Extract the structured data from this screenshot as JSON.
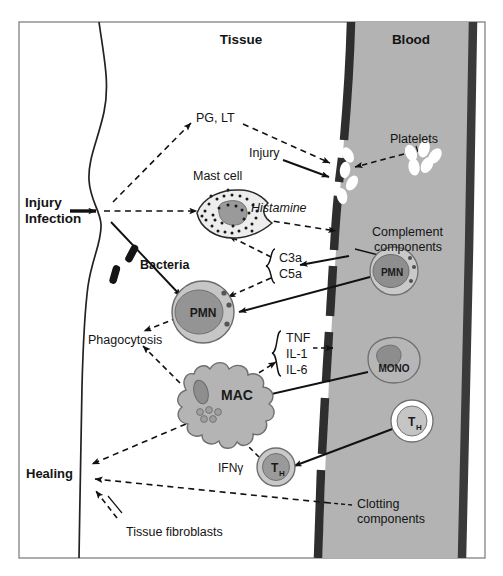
{
  "figure": {
    "compartments": {
      "tissue_label": "Tissue",
      "blood_label": "Blood"
    },
    "colors": {
      "blood_plasma": "#b3b3b3",
      "vessel_wall": "#3d3d3d",
      "cell_fill": "#b8b8b8",
      "cell_nucleus": "#8c8c8c",
      "mast_cell_fill": "#ededed",
      "platelet": "#ffffff",
      "outline": "#1a1a1a",
      "frame": "#8a8a8a",
      "text": "#141414"
    }
  },
  "labels": {
    "tissue": "Tissue",
    "blood": "Blood",
    "injury_infection_line1": "Injury",
    "injury_infection_line2": "Infection",
    "bacteria": "Bacteria",
    "mast_cell": "Mast cell",
    "pg_lt": "PG, LT",
    "injury": "Injury",
    "platelets": "Platelets",
    "histamine": "Histamine",
    "complement_line1": "Complement",
    "complement_line2": "components",
    "c3a": "C3a",
    "c5a": "C5a",
    "pmn_tissue": "PMN",
    "pmn_blood": "PMN",
    "phagocytosis": "Phagocytosis",
    "tnf": "TNF",
    "il1": "IL-1",
    "il6": "IL-6",
    "mono": "MONO",
    "mac": "MAC",
    "th_blood": "T",
    "th_blood_sub": "H",
    "th_tissue": "T",
    "th_tissue_sub": "H",
    "ifn_gamma": "IFNγ",
    "healing": "Healing",
    "tissue_fibroblasts": "Tissue fibroblasts",
    "clotting_line1": "Clotting",
    "clotting_line2": "components"
  },
  "cells": [
    {
      "name": "mast-cell",
      "label": "Mast cell",
      "compartment": "tissue"
    },
    {
      "name": "pmn-tissue",
      "label": "PMN",
      "compartment": "tissue"
    },
    {
      "name": "macrophage",
      "label": "MAC",
      "compartment": "tissue"
    },
    {
      "name": "th-tissue",
      "label": "TH",
      "compartment": "tissue"
    },
    {
      "name": "pmn-blood",
      "label": "PMN",
      "compartment": "blood"
    },
    {
      "name": "monocyte",
      "label": "MONO",
      "compartment": "blood"
    },
    {
      "name": "th-blood",
      "label": "TH",
      "compartment": "blood"
    },
    {
      "name": "platelet-cluster",
      "label": "Platelets",
      "compartment": "blood"
    },
    {
      "name": "bacteria",
      "label": "Bacteria",
      "compartment": "tissue"
    }
  ],
  "mediators": [
    {
      "name": "pg-lt",
      "label": "PG, LT"
    },
    {
      "name": "histamine",
      "label": "Histamine"
    },
    {
      "name": "c3a",
      "label": "C3a"
    },
    {
      "name": "c5a",
      "label": "C5a"
    },
    {
      "name": "tnf",
      "label": "TNF"
    },
    {
      "name": "il-1",
      "label": "IL-1"
    },
    {
      "name": "il-6",
      "label": "IL-6"
    },
    {
      "name": "ifn-gamma",
      "label": "IFNγ"
    }
  ],
  "outcomes": [
    {
      "name": "phagocytosis",
      "label": "Phagocytosis"
    },
    {
      "name": "healing",
      "label": "Healing"
    },
    {
      "name": "clotting",
      "label": "Clotting components"
    }
  ]
}
